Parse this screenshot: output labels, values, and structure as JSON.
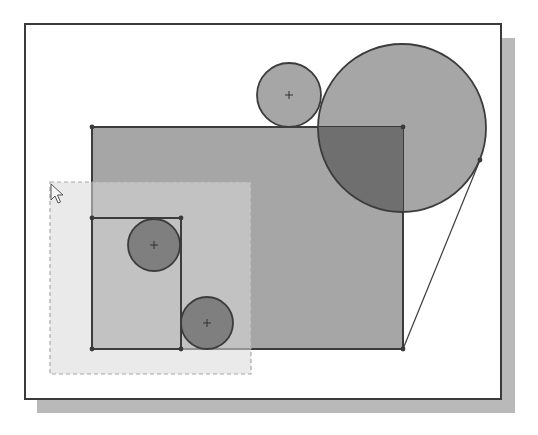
{
  "colors": {
    "background": "#ffffff",
    "frame_border": "#3a3a3a",
    "frame_fill": "#ffffff",
    "shadow": "#b9b9b9",
    "sketch_fill": "#a6a6a6",
    "overlap_fill": "#6f6f6f",
    "small_circle_fill": "#7f7f7f",
    "edge": "#3c3c3c",
    "selection_fill": "#d9d9d9",
    "selection_border": "#a8a8a8"
  },
  "frame": {
    "x": 25,
    "y": 24,
    "w": 476,
    "h": 375
  },
  "shadow": {
    "x": 37,
    "y": 38,
    "w": 478,
    "h": 375
  },
  "shapes": {
    "big_rectangle": {
      "x": 92,
      "y": 127,
      "w": 311,
      "h": 222
    },
    "big_circle": {
      "cx": 402,
      "cy": 128,
      "r": 84
    },
    "top_circle": {
      "cx": 289,
      "cy": 95,
      "r": 32
    },
    "inner_rectangle": {
      "x": 92,
      "y": 218,
      "w": 89,
      "h": 131
    },
    "circle_a": {
      "cx": 154,
      "cy": 245,
      "r": 26
    },
    "circle_b": {
      "cx": 207,
      "cy": 323,
      "r": 26
    },
    "tangent_line": {
      "x1": 480,
      "y1": 160,
      "x2": 403,
      "y2": 349
    }
  },
  "selection_box": {
    "x": 50,
    "y": 182,
    "w": 201,
    "h": 192
  },
  "cursor": {
    "x": 51,
    "y": 184
  }
}
